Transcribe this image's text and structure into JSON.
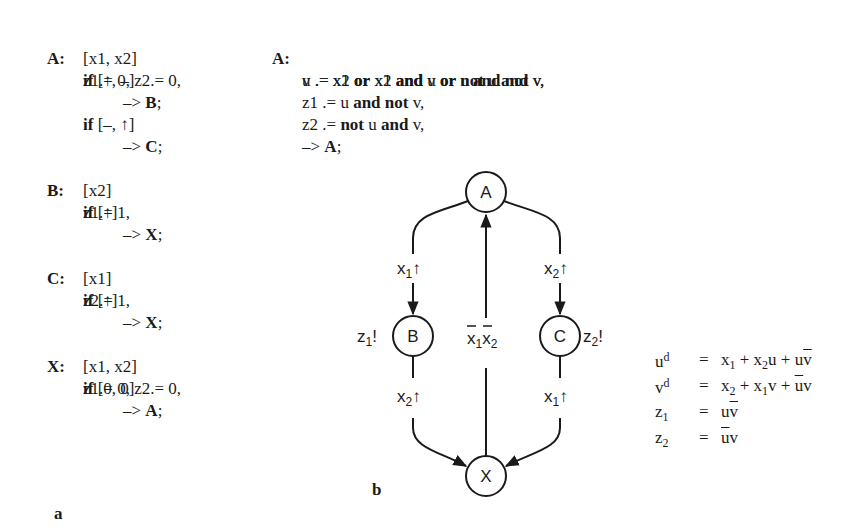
{
  "panel_a": {
    "label": "a",
    "states": [
      {
        "name": "A:",
        "lines": [
          "z1.= 0, z2.= 0,",
          "[x1, x2]",
          "if [↑, –]",
          "–> B;",
          "if [–, ↑]",
          "–> C;"
        ]
      },
      {
        "name": "B:",
        "lines": [
          "z1.= 1,",
          "[x2]",
          "if [↑]",
          "–> X;"
        ]
      },
      {
        "name": "C:",
        "lines": [
          "z2.= 1,",
          "[x1]",
          "if [↑]",
          "–> X;"
        ]
      },
      {
        "name": "X:",
        "lines": [
          "z1.= 0, z2.= 0,",
          "[x1, x2]",
          "if [0, 0]",
          "–> A;"
        ]
      }
    ]
  },
  "panel_b": {
    "label": "b",
    "code": {
      "name": "A:",
      "lines": [
        "u .= x1 or x2 and u or u and not v,",
        "v .= x2 or x1 and v or not u and v,",
        "z1 .= u and not v,",
        "z2 .= not u and v,",
        "–> A;"
      ]
    },
    "graph": {
      "nodes": [
        {
          "id": "A",
          "label": "A",
          "cx": 486,
          "cy": 192
        },
        {
          "id": "B",
          "label": "B",
          "cx": 413,
          "cy": 336,
          "output": "z1!"
        },
        {
          "id": "C",
          "label": "C",
          "cx": 560,
          "cy": 336,
          "output": "z2!"
        },
        {
          "id": "X",
          "label": "X",
          "cx": 486,
          "cy": 476
        }
      ],
      "edges": [
        {
          "from": "A",
          "to": "B",
          "label": "x1↑"
        },
        {
          "from": "A",
          "to": "C",
          "label": "x2↑"
        },
        {
          "from": "B",
          "to": "X",
          "label": "x2↑"
        },
        {
          "from": "C",
          "to": "X",
          "label": "x1↑"
        },
        {
          "from": "X",
          "to": "A",
          "label": "x̄1x̄2"
        }
      ]
    },
    "equations": [
      {
        "lhs": "u",
        "lhs_sup": "d",
        "rhs": "x1 + x2u + uv̄"
      },
      {
        "lhs": "v",
        "lhs_sup": "d",
        "rhs": "x2 + x1v + ūv"
      },
      {
        "lhs": "z",
        "lhs_sub": "1",
        "rhs": "uv̄"
      },
      {
        "lhs": "z",
        "lhs_sub": "2",
        "rhs": "ūv"
      }
    ],
    "equals": "="
  },
  "labels": {
    "node_A": "A",
    "node_B": "B",
    "node_C": "C",
    "node_X": "X",
    "x": "x",
    "z": "z",
    "one": "1",
    "two": "2",
    "up": "↑",
    "bang": "!",
    "kw_if": "if",
    "kw_or": "or",
    "kw_and": "and",
    "kw_not": "not",
    "arrow": "–>",
    "u": "u",
    "v": "v",
    "d": "d",
    "plus": "+"
  }
}
